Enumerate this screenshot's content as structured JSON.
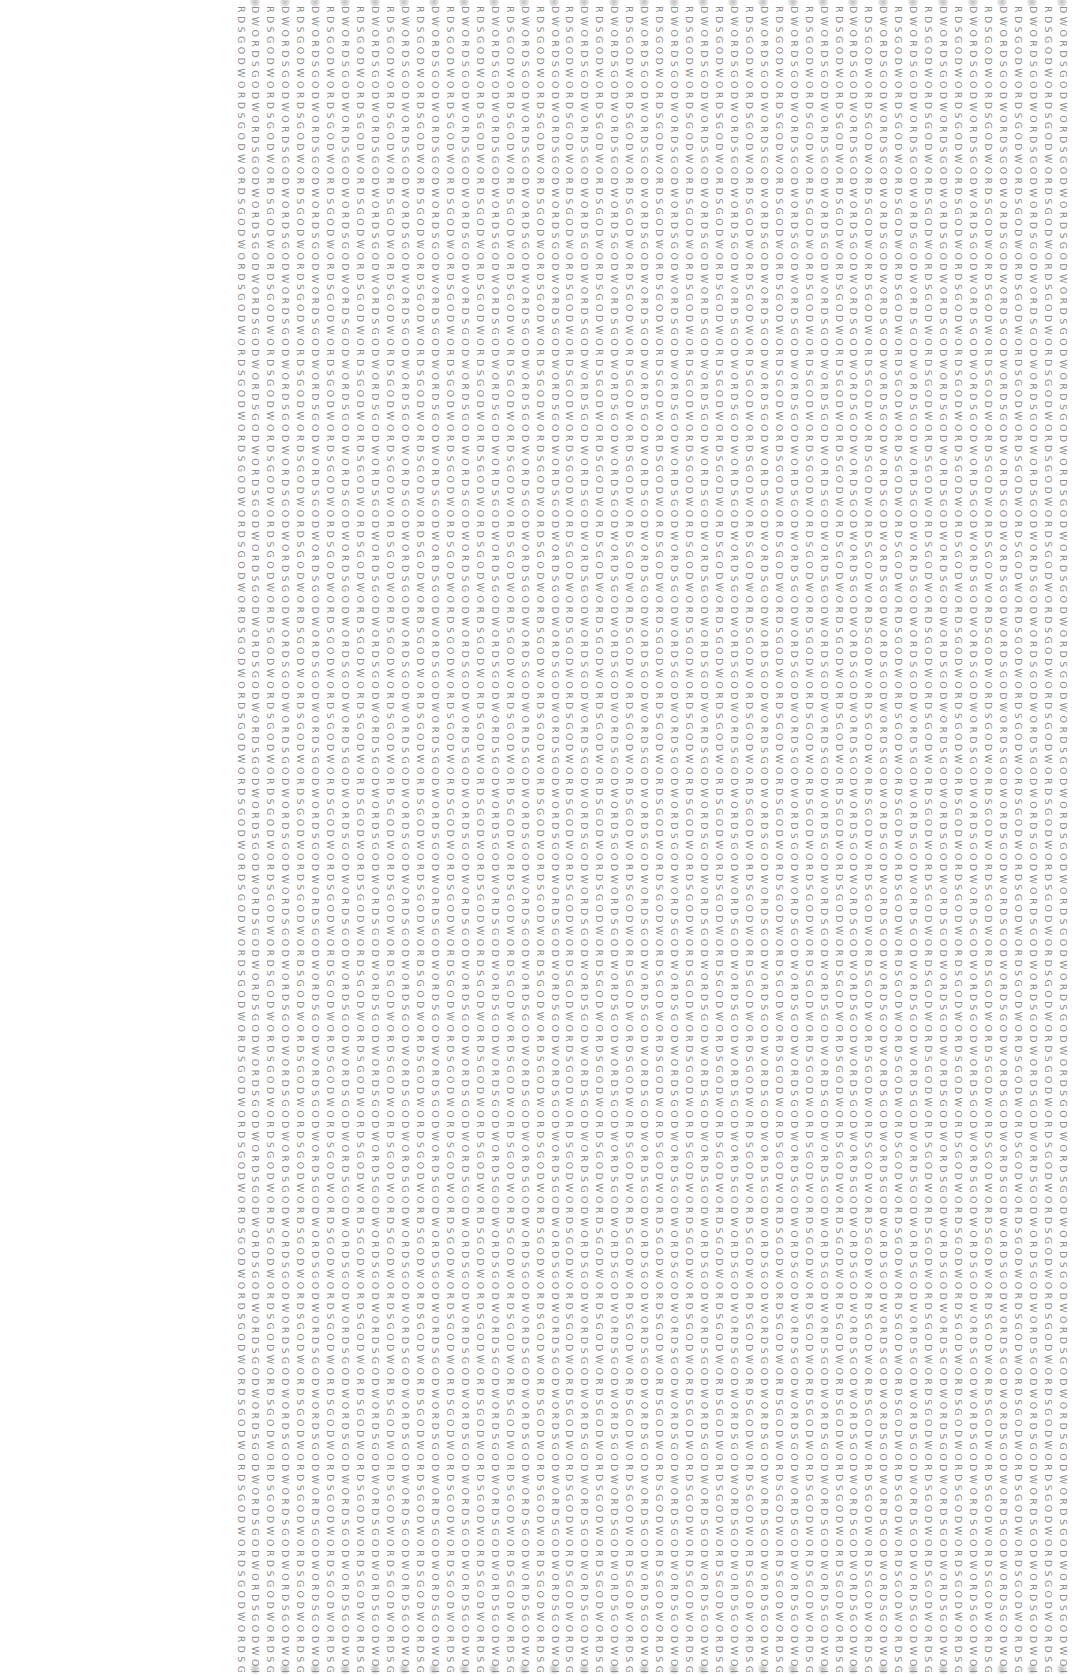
{
  "pattern": {
    "word": "DWORDSGO",
    "variant_a_start": "DWORDSGODWORDSGODWORDSGODWORDSGODWORDSGODWORDSGODWORDSGODWORDSGODWORDSGODWORDSGODWORDSGODWORDSGODWORDSGODWORDSGODWORDSGODWORDSGODWORDSGODWORDSGODWORDSGODWORDSGODWORDSGODWORDSGODWORDSGODWORDSGODWORDSGODWORDSGODWORDSGODWORDSGODWORDSGODWORDSGODWORDSGODWORDSGODWORDSGODWORDSGODWORDSGODWORDSGODWORDSGODWORDSGODWORDSGODWORDSGODWORDSGODWORDSGODWORDSGODWORDSGODWORDSGODWORDSGODWORDSGODWORDSGODWORDSGODWORDSGODWORDSGODWORDSGODWORDSGODWORDSGODWORDSGODWORDSGODWORDSGODWORDSGODWORDSGODWORDSGODWORDSGODWORDSGODWORDSGODWORDSGODWORDSGO",
    "variant_b_start": "RDSGODWORDSGODWORDSGODWORDSGODWORDSGODWORDSGODWORDSGODWORDSGODWORDSGODWORDSGODWORDSGODWORDSGODWORDSGODWORDSGODWORDSGODWORDSGODWORDSGODWORDSGODWORDSGODWORDSGODWORDSGODWORDSGODWORDSGODWORDSGODWORDSGODWORDSGODWORDSGODWORDSGODWORDSGODWORDSGODWORDSGODWORDSGODWORDSGODWORDSGODWORDSGODWORDSGODWORDSGODWORDSGODWORDSGODWORDSGODWORDSGODWORDSGODWORDSGODWORDSGODWORDSGODWORDSGODWORDSGODWORDSGODWORDSGODWORDSGODWORDSGODWORDSGODWORDSGODWORDSGODWORDSGODWORDSGODWORDSGODWORDSGODWORDSGODWORDSGODWORDSGODWORDSGODWORDSGODWORDSGODWORDSGODWORDSGODWORDSGODWORDS"
  },
  "columns": {
    "count": 56,
    "first_x": 236,
    "spacing": 14.95,
    "text_color": "#8c8c8c"
  },
  "background": "#ffffff"
}
